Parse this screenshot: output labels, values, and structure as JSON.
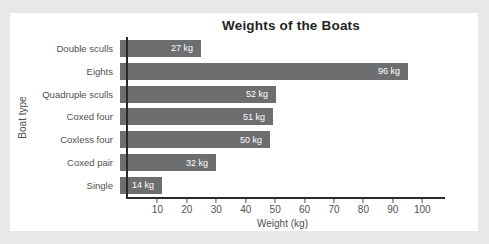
{
  "page": {
    "background_color": "#eae7e7",
    "card_color": "#ffffff"
  },
  "chart_data": {
    "type": "bar",
    "orientation": "horizontal",
    "title": "Weights of the Boats",
    "categories": [
      "Double sculls",
      "Eights",
      "Quadruple sculls",
      "Coxed four",
      "Coxless four",
      "Coxed pair",
      "Single"
    ],
    "values": [
      27,
      96,
      52,
      51,
      50,
      32,
      14
    ],
    "bar_labels": [
      "27 kg",
      "96 kg",
      "52 kg",
      "51 kg",
      "50 kg",
      "32 kg",
      "14 kg"
    ],
    "xlabel": "Weight (kg)",
    "ylabel": "Boat type",
    "xlim": [
      0,
      105
    ],
    "xticks": [
      10,
      20,
      30,
      40,
      50,
      60,
      70,
      80,
      90,
      100
    ],
    "grid": false,
    "legend": false,
    "bar_color": "#6d6e70",
    "bar_label_color": "#ffffff",
    "axis_color": "#2a2a2c",
    "text_color": "#4f5052"
  }
}
